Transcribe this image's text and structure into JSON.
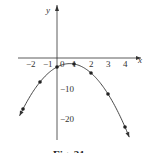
{
  "chart_data": {
    "type": "line",
    "title": "",
    "caption": "Fig. 31",
    "xlabel": "x",
    "ylabel": "y",
    "xlim": [
      -2.5,
      4.6
    ],
    "ylim": [
      -27,
      6
    ],
    "x_ticks": [
      "-2",
      "-1",
      "0",
      "1",
      "2",
      "3",
      "4"
    ],
    "y_ticks": [
      "-10",
      "-20"
    ],
    "grid": false,
    "legend": null,
    "function": "y = -2x^2 + 3x - 3",
    "series": [
      {
        "name": "parabola",
        "x": [
          -2,
          -1,
          0,
          1,
          2,
          3,
          4
        ],
        "values": [
          -17,
          -8,
          -3,
          -2,
          -5,
          -12,
          -23
        ],
        "marked_points": true
      }
    ]
  },
  "labels": {
    "x_axis": "x",
    "y_axis": "y",
    "xt": [
      "−2",
      "−1",
      "0",
      "1",
      "2",
      "3",
      "4"
    ],
    "yt": [
      "−10",
      "−20"
    ],
    "caption": "Fig. 31"
  }
}
